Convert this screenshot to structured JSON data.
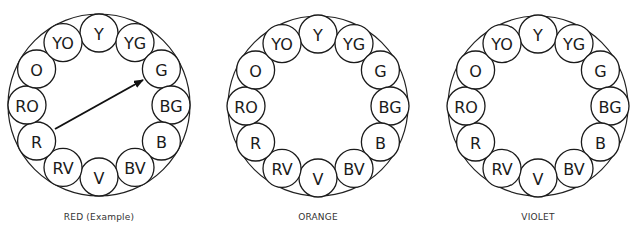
{
  "diagram": {
    "type": "color-wheel-set",
    "colors": {
      "stroke": "#1a1a1a",
      "background": "#ffffff"
    },
    "swatch_order_clockwise_from_top": [
      "Y",
      "YG",
      "G",
      "BG",
      "B",
      "BV",
      "V",
      "RV",
      "R",
      "RO",
      "O",
      "YO"
    ],
    "wheels": [
      {
        "id": "red",
        "caption": "RED (Example)",
        "center": [
          99,
          105
        ],
        "outer_radius": 91,
        "arrow": {
          "from": "R",
          "to": "G",
          "start": [
            55,
            129
          ],
          "end": [
            143,
            80
          ]
        }
      },
      {
        "id": "orange",
        "caption": "ORANGE",
        "center": [
          318,
          106
        ],
        "outer_radius": 90,
        "arrow": null
      },
      {
        "id": "violet",
        "caption": "VIOLET",
        "center": [
          538,
          106
        ],
        "outer_radius": 90,
        "arrow": null
      }
    ],
    "swatch_radius": 19,
    "swatch_ring_radius": 72
  }
}
